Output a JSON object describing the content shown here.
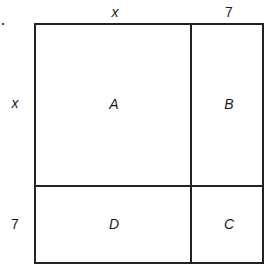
{
  "diagram": {
    "type": "area-model-square",
    "top_labels": {
      "left_segment": "x",
      "right_segment": "7"
    },
    "side_labels": {
      "top_segment": "x",
      "bottom_segment": "7"
    },
    "regions": {
      "top_left": "A",
      "top_right": "B",
      "bottom_right": "C",
      "bottom_left": "D"
    },
    "colors": {
      "line": "#222222",
      "background": "#ffffff",
      "text": "#1a1a1a"
    }
  }
}
